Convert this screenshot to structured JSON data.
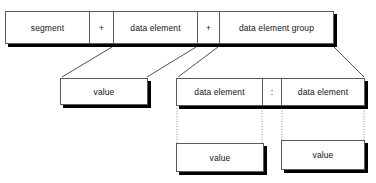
{
  "diagram": {
    "colors": {
      "box_border": "#5a5a5a",
      "box_fill": "#ffffff",
      "shadow": "#000000",
      "solid_connector": "#3c3c3c",
      "dotted_connector": "#8c8c8c",
      "text": "#141414"
    },
    "top_row": {
      "name": "segment-decomposition",
      "cells": [
        {
          "label": "segment",
          "kind": "term"
        },
        {
          "label": "+",
          "kind": "operator"
        },
        {
          "label": "data element",
          "kind": "term"
        },
        {
          "label": "+",
          "kind": "operator"
        },
        {
          "label": "data element group",
          "kind": "term"
        }
      ]
    },
    "value_left": {
      "cells": [
        {
          "label": "value",
          "kind": "term"
        }
      ]
    },
    "data_element_pair": {
      "cells": [
        {
          "label": "data element",
          "kind": "term"
        },
        {
          "label": ":",
          "kind": "operator"
        },
        {
          "label": "data element",
          "kind": "term"
        }
      ]
    },
    "value_bottom_left": {
      "cells": [
        {
          "label": "value",
          "kind": "term"
        }
      ]
    },
    "value_bottom_right": {
      "cells": [
        {
          "label": "value",
          "kind": "term"
        }
      ]
    }
  }
}
